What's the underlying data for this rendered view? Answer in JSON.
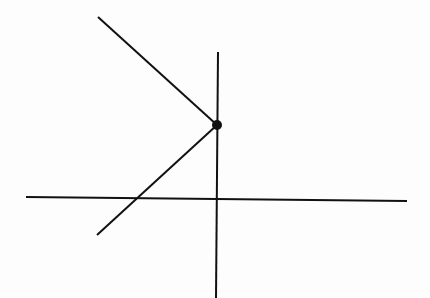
{
  "diagram": {
    "width": 430,
    "height": 298,
    "background": "#fdfdfd",
    "stroke_color": "#111111",
    "stroke_width": 2,
    "horizontal_axis": {
      "x1": 26,
      "y1": 197,
      "x2": 407,
      "y2": 201
    },
    "vertical_axis": {
      "x1": 218,
      "y1": 52,
      "x2": 216,
      "y2": 298
    },
    "upper_ray": {
      "x1": 98,
      "y1": 17,
      "x2": 217,
      "y2": 125
    },
    "lower_ray": {
      "x1": 217,
      "y1": 125,
      "x2": 97,
      "y2": 235
    },
    "vertex_point": {
      "cx": 217,
      "cy": 125,
      "r": 5
    }
  }
}
